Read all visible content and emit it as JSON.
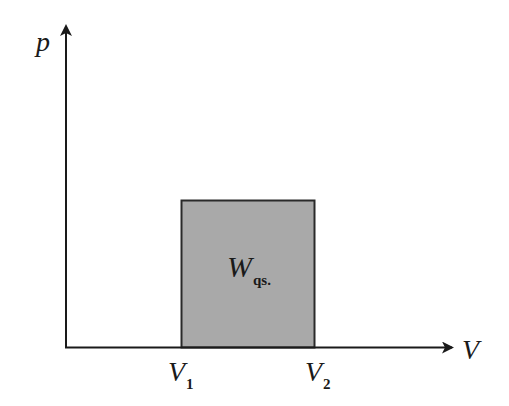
{
  "diagram": {
    "type": "p-V diagram",
    "colors": {
      "axis": "#1a1a1a",
      "rect_fill": "#a9a9a9",
      "rect_stroke": "#2a2a2a",
      "background": "#ffffff"
    },
    "axes": {
      "y_label": "p",
      "x_label": "V"
    },
    "ticks": [
      {
        "symbol": "V",
        "subscript": "1"
      },
      {
        "symbol": "V",
        "subscript": "2"
      }
    ],
    "region": {
      "symbol": "W",
      "subscript": "qs."
    }
  }
}
